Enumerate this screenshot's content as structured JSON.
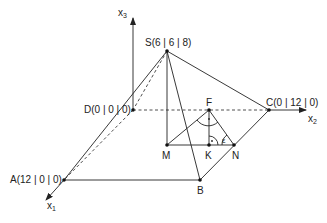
{
  "diagram": {
    "type": "3d-pyramid-coordinate-sketch",
    "axes": [
      {
        "id": "x1",
        "label": "x",
        "subscript": "1"
      },
      {
        "id": "x2",
        "label": "x",
        "subscript": "2"
      },
      {
        "id": "x3",
        "label": "x",
        "subscript": "3"
      }
    ],
    "points": {
      "S": {
        "label": "S(6 | 6 | 8)"
      },
      "D": {
        "label": "D(0 | 0 | 0)"
      },
      "C": {
        "label": "C(0 | 12 | 0)"
      },
      "A": {
        "label": "A(12 | 0 | 0)"
      },
      "B": {
        "label": "B"
      },
      "M": {
        "label": "M"
      },
      "K": {
        "label": "K"
      },
      "N": {
        "label": "N"
      },
      "F": {
        "label": "F"
      }
    },
    "angle": {
      "label": "ε",
      "at": "N"
    },
    "right_angles": [
      "F",
      "K"
    ],
    "colors": {
      "stroke": "#222222",
      "background": "#ffffff"
    }
  }
}
